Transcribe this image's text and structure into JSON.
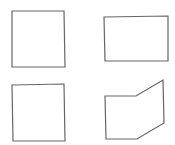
{
  "figure": {
    "stroke_color": "#666666",
    "background": "#ffffff",
    "shapes": [
      {
        "id": "top-left",
        "kind": "square"
      },
      {
        "id": "top-right",
        "kind": "rectangle"
      },
      {
        "id": "bottom-left",
        "kind": "square"
      },
      {
        "id": "bottom-right",
        "kind": "pentagon"
      }
    ]
  }
}
